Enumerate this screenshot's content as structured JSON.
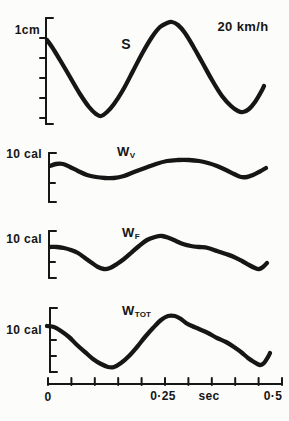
{
  "canvas": {
    "width": 289,
    "height": 421,
    "bg": "#fcfcfa",
    "ink": "#161616"
  },
  "style": {
    "curve_width": 4.3,
    "axis_width": 2,
    "tick_len": 6,
    "cap_len": 7
  },
  "chart_data": {
    "type": "line",
    "x_axis": {
      "unit": "sec",
      "range_sec": [
        0,
        0.5
      ],
      "tick_step_sec": 0.05,
      "num_ticks": 11,
      "y_px": 384,
      "x_start_px": 48,
      "x_end_px": 282,
      "tick_labels": [
        "0",
        "0·25",
        "sec",
        "0·5"
      ]
    },
    "panels": [
      {
        "name": "S",
        "curve_label": {
          "main": "S",
          "sub": ""
        },
        "y_scale_label": "1cm",
        "annotation": "20 km/h",
        "y_axis": {
          "x": 46,
          "top": 18,
          "bottom": 124,
          "tick_side": "left",
          "ticks_y": [
            38,
            58,
            78,
            98,
            118
          ]
        },
        "points_px": [
          [
            47,
            40
          ],
          [
            52,
            47
          ],
          [
            60,
            60
          ],
          [
            70,
            77
          ],
          [
            80,
            94
          ],
          [
            89,
            107
          ],
          [
            96,
            114
          ],
          [
            101,
            116
          ],
          [
            107,
            112
          ],
          [
            114,
            104
          ],
          [
            123,
            90
          ],
          [
            133,
            71
          ],
          [
            143,
            52
          ],
          [
            152,
            37
          ],
          [
            160,
            27
          ],
          [
            167,
            23
          ],
          [
            172,
            22
          ],
          [
            178,
            25
          ],
          [
            185,
            33
          ],
          [
            193,
            46
          ],
          [
            202,
            62
          ],
          [
            212,
            80
          ],
          [
            222,
            96
          ],
          [
            231,
            106
          ],
          [
            238,
            111
          ],
          [
            243,
            112
          ],
          [
            249,
            109
          ],
          [
            255,
            102
          ],
          [
            261,
            92
          ],
          [
            264,
            86
          ]
        ]
      },
      {
        "name": "W_V",
        "curve_label": {
          "main": "W",
          "sub": "V"
        },
        "y_scale_label": "10 cal",
        "annotation": "",
        "y_axis": {
          "x": 49,
          "top": 153,
          "bottom": 202,
          "tick_side": "right",
          "ticks_y": [
            183
          ]
        },
        "points_px": [
          [
            50,
            166
          ],
          [
            56,
            164
          ],
          [
            63,
            164
          ],
          [
            70,
            167
          ],
          [
            78,
            171
          ],
          [
            87,
            175
          ],
          [
            96,
            177
          ],
          [
            105,
            178
          ],
          [
            114,
            178
          ],
          [
            124,
            176
          ],
          [
            134,
            172
          ],
          [
            145,
            168
          ],
          [
            156,
            164
          ],
          [
            167,
            161
          ],
          [
            178,
            160
          ],
          [
            189,
            160
          ],
          [
            199,
            161
          ],
          [
            208,
            163
          ],
          [
            217,
            166
          ],
          [
            226,
            170
          ],
          [
            234,
            174
          ],
          [
            241,
            177
          ],
          [
            247,
            177
          ],
          [
            253,
            175
          ],
          [
            259,
            172
          ],
          [
            266,
            168
          ]
        ]
      },
      {
        "name": "W_F",
        "curve_label": {
          "main": "W",
          "sub": "F"
        },
        "y_scale_label": "10 cal",
        "annotation": "",
        "y_axis": {
          "x": 49,
          "top": 231,
          "bottom": 278,
          "tick_side": "right",
          "ticks_y": [
            262
          ]
        },
        "points_px": [
          [
            50,
            247
          ],
          [
            57,
            247
          ],
          [
            64,
            248
          ],
          [
            71,
            250
          ],
          [
            78,
            253
          ],
          [
            85,
            258
          ],
          [
            92,
            263
          ],
          [
            98,
            267
          ],
          [
            104,
            269
          ],
          [
            110,
            268
          ],
          [
            117,
            264
          ],
          [
            124,
            259
          ],
          [
            131,
            253
          ],
          [
            139,
            246
          ],
          [
            147,
            240
          ],
          [
            155,
            237
          ],
          [
            162,
            236
          ],
          [
            169,
            238
          ],
          [
            176,
            241
          ],
          [
            183,
            244
          ],
          [
            191,
            246
          ],
          [
            199,
            247
          ],
          [
            208,
            248
          ],
          [
            217,
            251
          ],
          [
            226,
            254
          ],
          [
            234,
            257
          ],
          [
            242,
            261
          ],
          [
            249,
            265
          ],
          [
            255,
            268
          ],
          [
            259,
            269
          ],
          [
            263,
            267
          ],
          [
            267,
            263
          ]
        ]
      },
      {
        "name": "W_TOT",
        "curve_label": {
          "main": "W",
          "sub": "TOT"
        },
        "y_scale_label": "10 cal",
        "annotation": "",
        "y_axis": {
          "x": 50,
          "top": 308,
          "bottom": 372,
          "tick_side": "right",
          "ticks_y": [
            340,
            356
          ]
        },
        "points_px": [
          [
            47,
            326
          ],
          [
            54,
            327
          ],
          [
            61,
            331
          ],
          [
            69,
            337
          ],
          [
            77,
            345
          ],
          [
            85,
            352
          ],
          [
            93,
            359
          ],
          [
            101,
            364
          ],
          [
            108,
            367
          ],
          [
            114,
            367
          ],
          [
            121,
            363
          ],
          [
            129,
            356
          ],
          [
            137,
            347
          ],
          [
            145,
            337
          ],
          [
            153,
            328
          ],
          [
            161,
            320
          ],
          [
            168,
            316
          ],
          [
            175,
            316
          ],
          [
            181,
            319
          ],
          [
            186,
            323
          ],
          [
            192,
            326
          ],
          [
            199,
            329
          ],
          [
            208,
            333
          ],
          [
            217,
            338
          ],
          [
            226,
            342
          ],
          [
            234,
            347
          ],
          [
            241,
            352
          ],
          [
            248,
            358
          ],
          [
            254,
            362
          ],
          [
            260,
            365
          ],
          [
            264,
            363
          ],
          [
            268,
            357
          ],
          [
            270,
            353
          ]
        ]
      }
    ]
  },
  "labels": [
    {
      "name": "s-scale-label",
      "text": "1cm",
      "x": 40,
      "y": 33,
      "anchor": "end",
      "size": 12
    },
    {
      "name": "speed-annotation",
      "text": "20 km/h",
      "x": 243,
      "y": 30,
      "anchor": "middle",
      "size": 13
    },
    {
      "name": "curve-label-s",
      "text": "S",
      "x": 126,
      "y": 48,
      "anchor": "middle",
      "size": 14
    },
    {
      "name": "curve-label-wv",
      "main": "W",
      "sub": "V",
      "x": 117,
      "y": 155,
      "anchor": "start",
      "size": 13
    },
    {
      "name": "wv-scale-label",
      "text": "10 cal",
      "x": 42,
      "y": 157,
      "anchor": "end",
      "size": 12
    },
    {
      "name": "curve-label-wf",
      "main": "W",
      "sub": "F",
      "x": 122,
      "y": 236,
      "anchor": "start",
      "size": 13
    },
    {
      "name": "wf-scale-label",
      "text": "10 cal",
      "x": 42,
      "y": 242,
      "anchor": "end",
      "size": 12
    },
    {
      "name": "curve-label-wtot",
      "main": "W",
      "sub": "TOT",
      "x": 122,
      "y": 314,
      "anchor": "start",
      "size": 13
    },
    {
      "name": "wtot-scale-label",
      "text": "10 cal",
      "x": 42,
      "y": 333,
      "anchor": "end",
      "size": 12
    },
    {
      "name": "x-tick-label-0",
      "text": "0",
      "x": 48,
      "y": 400,
      "anchor": "middle",
      "size": 12
    },
    {
      "name": "x-tick-label-025",
      "text": "0·25",
      "x": 163,
      "y": 399,
      "anchor": "middle",
      "size": 12
    },
    {
      "name": "x-axis-unit",
      "text": "sec",
      "x": 209,
      "y": 399,
      "anchor": "middle",
      "size": 12
    },
    {
      "name": "x-tick-label-05",
      "text": "0·5",
      "x": 273,
      "y": 399,
      "anchor": "middle",
      "size": 12
    }
  ]
}
